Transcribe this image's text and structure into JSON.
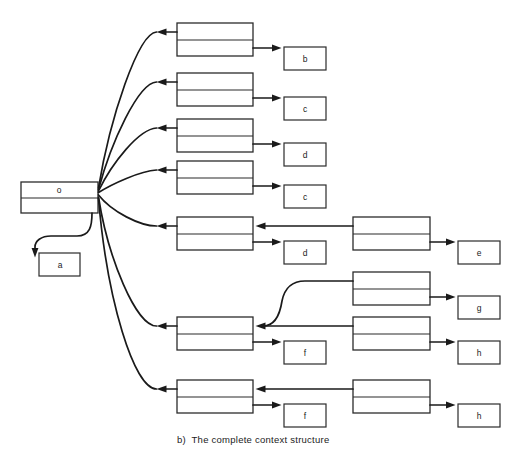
{
  "caption": "b)  The complete context structure",
  "colors": {
    "background": "#ffffff",
    "line": "#1a1a1a",
    "box_stroke": "#2b2b2b",
    "text": "#222222"
  },
  "diagram": {
    "root": {
      "label": "o"
    },
    "orphan": {
      "label": "a"
    },
    "contexts": [
      {
        "row": 1,
        "value": "b"
      },
      {
        "row": 2,
        "value": "c"
      },
      {
        "row": 3,
        "value": "d"
      },
      {
        "row": 4,
        "value": "c"
      },
      {
        "row": 5,
        "value": "d",
        "children": [
          {
            "value": "e"
          }
        ]
      },
      {
        "row": 6,
        "value": "f",
        "children": [
          {
            "value": "g"
          },
          {
            "value": "h"
          }
        ]
      },
      {
        "row": 7,
        "value": "f",
        "children": [
          {
            "value": "h"
          }
        ]
      }
    ]
  }
}
